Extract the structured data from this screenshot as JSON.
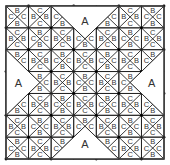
{
  "diagram": {
    "title": "",
    "grid": {
      "cols": 7,
      "rows": 7,
      "origin_x": 6,
      "origin_y": 6,
      "cell_size": 22.6
    },
    "cell_labels": {
      "even": {
        "top": "B",
        "bottom": "B",
        "left": "C",
        "right": "C"
      },
      "odd": {
        "top": "C",
        "bottom": "C",
        "left": "B",
        "right": "B"
      }
    },
    "a_regions": [
      {
        "name": "top",
        "label": "A",
        "points": [
          [
            2,
            0
          ],
          [
            5,
            0
          ],
          [
            3.5,
            1.5
          ]
        ],
        "label_pos": [
          3.5,
          0.7
        ]
      },
      {
        "name": "bottom",
        "label": "A",
        "points": [
          [
            2,
            7
          ],
          [
            5,
            7
          ],
          [
            3.5,
            5.5
          ]
        ],
        "label_pos": [
          3.5,
          6.3
        ]
      },
      {
        "name": "left",
        "label": "A",
        "points": [
          [
            0,
            2
          ],
          [
            0,
            5
          ],
          [
            1.5,
            3.5
          ]
        ],
        "label_pos": [
          0.55,
          3.5
        ]
      },
      {
        "name": "right",
        "label": "A",
        "points": [
          [
            7,
            2
          ],
          [
            7,
            5
          ],
          [
            5.5,
            3.5
          ]
        ],
        "label_pos": [
          6.45,
          3.5
        ]
      }
    ],
    "colors": {
      "line": "#222222",
      "node": "#000000",
      "text": "#333333",
      "background": "#ffffff"
    }
  }
}
